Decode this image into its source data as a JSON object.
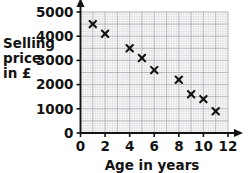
{
  "chart_data": {
    "type": "scatter",
    "title": "",
    "xlabel": "Age in years",
    "ylabel": "Selling price in £",
    "ylabel_lines": [
      "Selling",
      "price",
      "in £"
    ],
    "xlim": [
      0,
      12
    ],
    "ylim": [
      0,
      5000
    ],
    "xticks": [
      0,
      2,
      4,
      6,
      8,
      10,
      12
    ],
    "xtick_labels": [
      "0",
      "2",
      "4",
      "6",
      "8",
      "10",
      "12"
    ],
    "yticks": [
      0,
      1000,
      2000,
      3000,
      4000,
      5000
    ],
    "ytick_labels": [
      "0",
      "1000",
      "2000",
      "3000",
      "4000",
      "5000"
    ],
    "grid": true,
    "grid_minor_step_x": 0.2,
    "grid_minor_step_y": 100,
    "grid_major_step_x": 1,
    "grid_major_step_y": 500,
    "legend": "none",
    "marker": "x",
    "marker_color": "#111111",
    "points": [
      {
        "x": 1,
        "y": 4500
      },
      {
        "x": 2,
        "y": 4100
      },
      {
        "x": 4,
        "y": 3500
      },
      {
        "x": 5,
        "y": 3100
      },
      {
        "x": 6,
        "y": 2600
      },
      {
        "x": 8,
        "y": 2200
      },
      {
        "x": 9,
        "y": 1600
      },
      {
        "x": 10,
        "y": 1400
      },
      {
        "x": 11,
        "y": 900
      }
    ]
  },
  "colors": {
    "marker": "#111111",
    "axis": "#141414",
    "grid_minor": "#c9c9cf",
    "grid_major": "#a9a9b2",
    "text": "#131313",
    "background": "#ffffff"
  }
}
